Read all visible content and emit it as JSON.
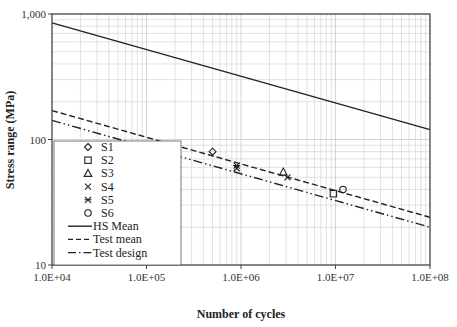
{
  "chart_data": {
    "type": "scatter",
    "title": "",
    "xlabel": "Number of cycles",
    "ylabel": "Stress range (MPa)",
    "xscale": "log",
    "yscale": "log",
    "xlim": [
      10000,
      100000000
    ],
    "ylim": [
      10,
      1000
    ],
    "x_tick_labels": [
      "1.0E+04",
      "1.0E+05",
      "1.0E+06",
      "1.0E+07",
      "1.0E+08"
    ],
    "y_tick_labels": [
      "10",
      "100",
      "1,000"
    ],
    "grid": true,
    "legend_position": "lower-left inside",
    "series": [
      {
        "name": "S1",
        "kind": "points",
        "marker": "diamond-open",
        "points": [
          [
            500000,
            80
          ]
        ]
      },
      {
        "name": "S2",
        "kind": "points",
        "marker": "square-open",
        "points": [
          [
            9500000,
            37
          ]
        ]
      },
      {
        "name": "S3",
        "kind": "points",
        "marker": "triangle-open",
        "points": [
          [
            2800000,
            55
          ]
        ]
      },
      {
        "name": "S4",
        "kind": "points",
        "marker": "x",
        "points": [
          [
            900000,
            59
          ],
          [
            3100000,
            50
          ]
        ]
      },
      {
        "name": "S5",
        "kind": "points",
        "marker": "asterisk",
        "points": [
          [
            900000,
            62
          ]
        ]
      },
      {
        "name": "S6",
        "kind": "points",
        "marker": "circle-open",
        "points": [
          [
            12000000,
            40
          ]
        ]
      },
      {
        "name": "HS Mean",
        "kind": "line",
        "style": "solid",
        "points": [
          [
            10000,
            850
          ],
          [
            100000000,
            120
          ]
        ]
      },
      {
        "name": "Test mean",
        "kind": "line",
        "style": "dashed",
        "points": [
          [
            10000,
            170
          ],
          [
            100000000,
            24
          ]
        ]
      },
      {
        "name": "Test design",
        "kind": "line",
        "style": "dash-dot-dot",
        "points": [
          [
            10000,
            142
          ],
          [
            100000000,
            20
          ]
        ]
      }
    ]
  },
  "axes": {
    "xlabel": "Number of cycles",
    "ylabel": "Stress range (MPa)",
    "xticks": [
      "1.0E+04",
      "1.0E+05",
      "1.0E+06",
      "1.0E+07",
      "1.0E+08"
    ],
    "yticks": [
      "10",
      "100",
      "1,000"
    ]
  },
  "legend": {
    "items": [
      {
        "label": "S1"
      },
      {
        "label": "S2"
      },
      {
        "label": "S3"
      },
      {
        "label": "S4"
      },
      {
        "label": "S5"
      },
      {
        "label": "S6"
      },
      {
        "label": "HS Mean"
      },
      {
        "label": "Test mean"
      },
      {
        "label": "Test design"
      }
    ]
  },
  "colors": {
    "line": "#222222",
    "grid": "#cfcfcf",
    "frame": "#444444"
  }
}
